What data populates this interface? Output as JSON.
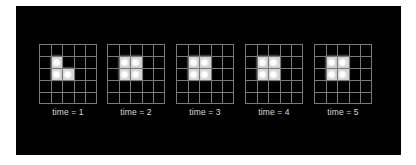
{
  "figure": {
    "background": "#000000",
    "grid_color": "#7a7a7a",
    "live_cell_color": "#d4d4d4",
    "grid_rows": 5,
    "grid_cols": 5,
    "panels": [
      {
        "label": "time = 1",
        "live_cells": [
          [
            1,
            1
          ],
          [
            2,
            1
          ],
          [
            2,
            2
          ]
        ]
      },
      {
        "label": "time = 2",
        "live_cells": [
          [
            1,
            1
          ],
          [
            1,
            2
          ],
          [
            2,
            1
          ],
          [
            2,
            2
          ]
        ]
      },
      {
        "label": "time = 3",
        "live_cells": [
          [
            1,
            1
          ],
          [
            1,
            2
          ],
          [
            2,
            1
          ],
          [
            2,
            2
          ]
        ]
      },
      {
        "label": "time = 4",
        "live_cells": [
          [
            1,
            1
          ],
          [
            1,
            2
          ],
          [
            2,
            1
          ],
          [
            2,
            2
          ]
        ]
      },
      {
        "label": "time = 5",
        "live_cells": [
          [
            1,
            1
          ],
          [
            1,
            2
          ],
          [
            2,
            1
          ],
          [
            2,
            2
          ]
        ]
      }
    ]
  }
}
